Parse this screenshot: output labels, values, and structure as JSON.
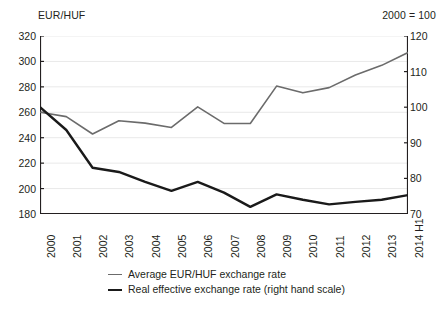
{
  "chart_data": {
    "type": "line",
    "title_left": "EUR/HUF",
    "title_right": "2000 = 100",
    "xlabel": "",
    "categories": [
      "2000",
      "2001",
      "2002",
      "2003",
      "2004",
      "2005",
      "2006",
      "2007",
      "2008",
      "2009",
      "2010",
      "2011",
      "2012",
      "2013",
      "2014 H1"
    ],
    "axes": {
      "left": {
        "label": "EUR/HUF",
        "ylim": [
          180,
          320
        ],
        "ticks": [
          180,
          200,
          220,
          240,
          260,
          280,
          300,
          320
        ],
        "grid": true
      },
      "right": {
        "label": "2000 = 100",
        "ylim": [
          70,
          120
        ],
        "ticks": [
          70,
          80,
          90,
          100,
          110,
          120
        ],
        "grid": false
      }
    },
    "series": [
      {
        "name": "Average EUR/HUF exchange rate",
        "axis": "left",
        "color": "#6b6b6b",
        "width": 1.6,
        "values": [
          260.0,
          256.6,
          242.9,
          253.4,
          251.5,
          248.1,
          264.3,
          251.3,
          251.2,
          280.6,
          275.3,
          279.4,
          289.3,
          296.9,
          307.0
        ]
      },
      {
        "name": "Real effective exchange rate (right hand scale)",
        "axis": "right",
        "color": "#1a1a1a",
        "width": 2.4,
        "values": [
          100.0,
          93.6,
          83.0,
          81.8,
          79.0,
          76.5,
          79.0,
          76.0,
          72.0,
          75.5,
          74.0,
          72.7,
          73.4,
          74.0,
          75.3
        ]
      }
    ],
    "legend": {
      "position": "bottom",
      "entries": [
        {
          "label": "Average EUR/HUF exchange rate",
          "color": "#6b6b6b",
          "width": 1.8
        },
        {
          "label": "Real effective exchange rate (right hand scale)",
          "color": "#1a1a1a",
          "width": 2.6
        }
      ]
    }
  }
}
